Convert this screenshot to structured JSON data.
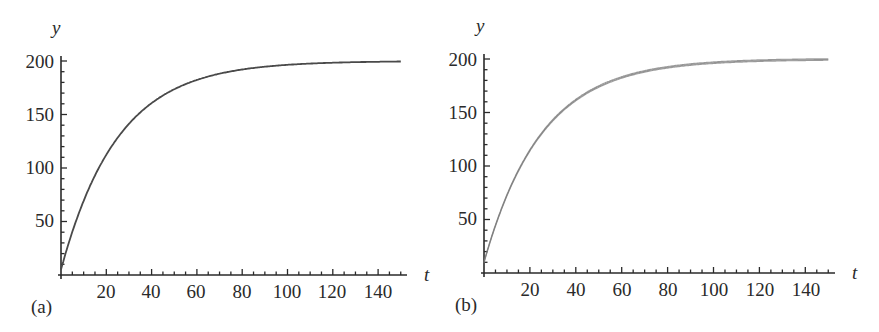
{
  "figure": {
    "panels": [
      {
        "id": "a",
        "panel_label": "(a)",
        "xlabel": "t",
        "ylabel": "y",
        "x_ticks": [
          "20",
          "40",
          "60",
          "80",
          "100",
          "120",
          "140"
        ],
        "y_ticks": [
          "50",
          "100",
          "150",
          "200"
        ],
        "curve_color": "#4a4a4a"
      },
      {
        "id": "b",
        "panel_label": "(b)",
        "xlabel": "t",
        "ylabel": "y",
        "x_ticks": [
          "20",
          "40",
          "60",
          "80",
          "100",
          "120",
          "140"
        ],
        "y_ticks": [
          "50",
          "100",
          "150",
          "200"
        ],
        "curve_color": "#777777"
      }
    ]
  },
  "chart_data": [
    {
      "type": "line",
      "title": "(a)",
      "xlabel": "t",
      "ylabel": "y",
      "xlim": [
        0,
        150
      ],
      "ylim": [
        0,
        200
      ],
      "x_ticks": [
        20,
        40,
        60,
        80,
        100,
        120,
        140
      ],
      "y_ticks": [
        50,
        100,
        150,
        200
      ],
      "x_minor_step": 5,
      "y_minor_step": 10,
      "grid": false,
      "legend": null,
      "series": [
        {
          "name": "y(t)",
          "x": [
            0,
            5,
            10,
            15,
            20,
            30,
            40,
            50,
            60,
            70,
            80,
            90,
            100,
            110,
            120,
            130,
            140,
            150
          ],
          "values": [
            5,
            40,
            69,
            93,
            112,
            141,
            161,
            174,
            182,
            188,
            192,
            195,
            196,
            198,
            198,
            199,
            199,
            200
          ]
        }
      ]
    },
    {
      "type": "line",
      "title": "(b)",
      "xlabel": "t",
      "ylabel": "y",
      "xlim": [
        0,
        150
      ],
      "ylim": [
        0,
        200
      ],
      "x_ticks": [
        20,
        40,
        60,
        80,
        100,
        120,
        140
      ],
      "y_ticks": [
        50,
        100,
        150,
        200
      ],
      "x_minor_step": 5,
      "y_minor_step": 10,
      "grid": false,
      "legend": null,
      "series": [
        {
          "name": "y(t) (multiple overlaid sample paths)",
          "x": [
            0,
            5,
            10,
            15,
            20,
            30,
            40,
            50,
            60,
            70,
            80,
            90,
            100,
            110,
            120,
            130,
            140,
            150
          ],
          "values": [
            10,
            45,
            73,
            96,
            114,
            142,
            161,
            174,
            183,
            189,
            193,
            195,
            197,
            198,
            199,
            199,
            200,
            200
          ]
        }
      ]
    }
  ]
}
